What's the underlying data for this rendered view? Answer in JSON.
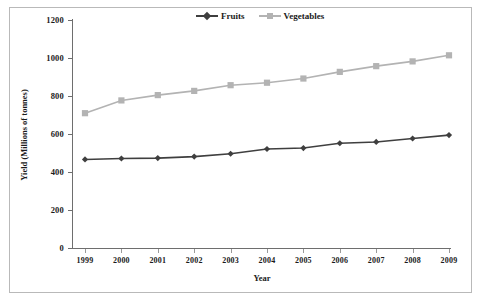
{
  "chart_data": {
    "type": "line",
    "title": "",
    "xlabel": "Year",
    "ylabel": "Yield (Millions of tonnes)",
    "categories": [
      "1999",
      "2000",
      "2001",
      "2002",
      "2003",
      "2004",
      "2005",
      "2006",
      "2007",
      "2008",
      "2009"
    ],
    "ylim": [
      0,
      1200
    ],
    "yticks": [
      0,
      200,
      400,
      600,
      800,
      1000,
      1200
    ],
    "grid": false,
    "legend_position": "top-center",
    "series": [
      {
        "name": "Fruits",
        "color": "#3f3f3f",
        "marker": "diamond",
        "values": [
          465,
          470,
          472,
          480,
          495,
          520,
          525,
          550,
          557,
          575,
          593
        ]
      },
      {
        "name": "Vegetables",
        "color": "#b3b3b3",
        "marker": "square",
        "values": [
          708,
          775,
          803,
          825,
          855,
          868,
          890,
          925,
          955,
          980,
          1012
        ]
      }
    ]
  },
  "legend": {
    "items": [
      {
        "label": "Fruits"
      },
      {
        "label": "Vegetables"
      }
    ]
  },
  "axes": {
    "y_title": "Yield (Millions of tonnes)",
    "x_title": "Year"
  }
}
